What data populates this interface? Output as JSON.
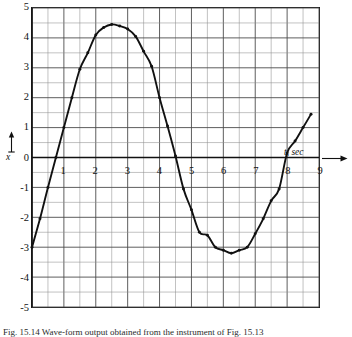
{
  "figure": {
    "caption": "Fig. 15.14  Wave-form output obtained from the instrument of Fig. 15.13"
  },
  "axes": {
    "x_title": "t, sec",
    "y_title": "x",
    "x_arrow_icon": "arrow-right-icon",
    "y_arrow_icon": "arrow-up-icon"
  },
  "chart_data": {
    "type": "line",
    "title": "",
    "xlabel": "t, sec",
    "ylabel": "x",
    "xlim": [
      0,
      9
    ],
    "ylim": [
      -5,
      5
    ],
    "xticks": [
      1,
      2,
      3,
      4,
      5,
      6,
      7,
      8,
      9
    ],
    "yticks": [
      5,
      4,
      3,
      2,
      1,
      0,
      -1,
      -2,
      -3,
      -4,
      -5
    ],
    "xtick_labels": [
      "1",
      "2",
      "3",
      "4",
      "5",
      "6",
      "7",
      "8",
      "9"
    ],
    "ytick_labels": [
      "5",
      "4",
      "3",
      "2",
      "1",
      "0",
      "-1",
      "-2",
      "-3",
      "-4",
      "-5"
    ],
    "grid": true,
    "grid_major_step_x": 1.0,
    "grid_major_step_y": 1.0,
    "grid_minor_step_x": 0.5,
    "grid_minor_step_y": 0.5,
    "legend": false,
    "series": [
      {
        "name": "x(t)",
        "marker": "dot",
        "line_color": "#111111",
        "x": [
          0.0,
          0.25,
          0.5,
          0.75,
          1.0,
          1.25,
          1.5,
          1.75,
          2.0,
          2.25,
          2.5,
          2.75,
          3.0,
          3.25,
          3.5,
          3.75,
          4.0,
          4.25,
          4.5,
          4.75,
          5.0,
          5.25,
          5.5,
          5.75,
          6.0,
          6.25,
          6.5,
          6.75,
          7.0,
          7.25,
          7.5,
          7.75,
          8.0,
          8.25,
          8.5,
          8.75
        ],
        "y": [
          -3.0,
          -2.05,
          -1.0,
          0.0,
          1.0,
          2.0,
          2.95,
          3.5,
          4.1,
          4.35,
          4.45,
          4.4,
          4.3,
          4.05,
          3.55,
          3.05,
          2.0,
          1.05,
          0.05,
          -1.05,
          -1.75,
          -2.5,
          -2.6,
          -3.0,
          -3.1,
          -3.2,
          -3.1,
          -3.0,
          -2.55,
          -2.05,
          -1.45,
          -1.05,
          0.15,
          0.55,
          1.0,
          1.45
        ]
      }
    ],
    "annotations": [
      {
        "text": "peak",
        "t": 2.5,
        "x": 4.45
      },
      {
        "text": "trough",
        "t": 6.25,
        "x": -3.2
      },
      {
        "text": "zero-crossing-rising",
        "t": 0.75,
        "x": 0.0
      },
      {
        "text": "zero-crossing-falling",
        "t": 4.5,
        "x": 0.05
      }
    ]
  }
}
